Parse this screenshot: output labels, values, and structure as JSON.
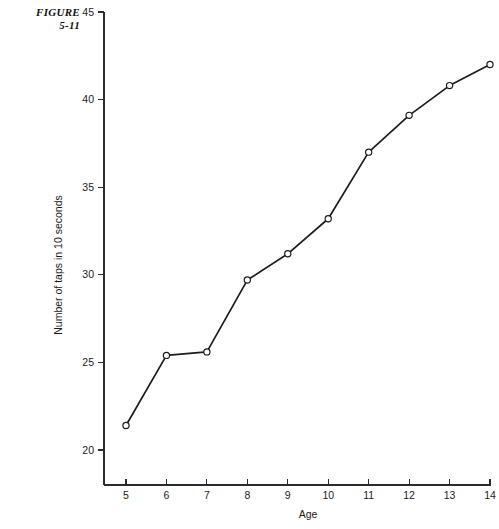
{
  "figure": {
    "label_line1": "FIGURE",
    "label_line2": "5-11"
  },
  "chart_data": {
    "type": "line",
    "title": "",
    "xlabel": "Age",
    "ylabel": "Number of taps in 10 seconds",
    "x": [
      5,
      6,
      7,
      8,
      9,
      10,
      11,
      12,
      13,
      14
    ],
    "values": [
      21.4,
      25.4,
      25.6,
      29.7,
      31.2,
      33.2,
      37.0,
      39.1,
      40.8,
      42.0
    ],
    "xticks": [
      "5",
      "6",
      "7",
      "8",
      "9",
      "10",
      "11",
      "12",
      "13",
      "14"
    ],
    "yticks": [
      "20",
      "25",
      "30",
      "35",
      "40",
      "45"
    ],
    "ytick_values": [
      20,
      25,
      30,
      35,
      40,
      45
    ],
    "xlim": [
      4.6,
      14.0
    ],
    "ylim": [
      18.5,
      45.0
    ],
    "grid": false,
    "legend": "none",
    "marker": "open-circle",
    "line_color": "#1c1c1c",
    "marker_fill": "#ffffff",
    "background": "#ffffff"
  }
}
